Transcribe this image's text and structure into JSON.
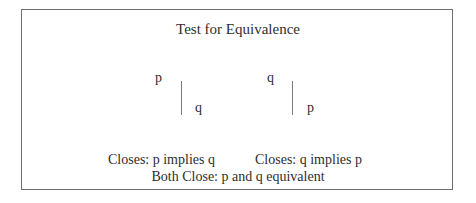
{
  "diagram": {
    "title": "Test for Equivalence",
    "left_tree": {
      "premise": "p",
      "conclusion": "q"
    },
    "right_tree": {
      "premise": "q",
      "conclusion": "p"
    },
    "captions": {
      "left": "Closes: p implies q",
      "right": "Closes: q implies p",
      "both": "Both Close: p and q equivalent"
    },
    "colors": {
      "border": "#6e6e6e",
      "line": "#7a7a7a",
      "text": "#2e2e2e"
    }
  }
}
